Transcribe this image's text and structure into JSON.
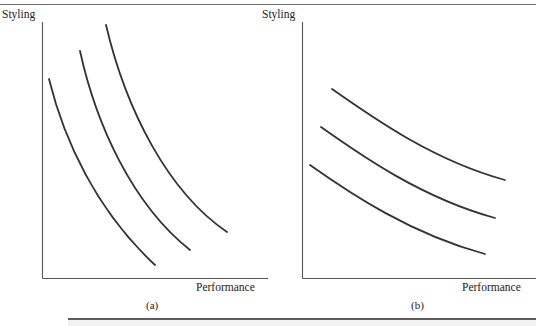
{
  "figure": {
    "rules": {
      "top_rule": "horizontal-rule",
      "bottom_rule": "horizontal-rule"
    },
    "panels": [
      {
        "id": "a",
        "caption": "(a)",
        "y_axis_label": "Styling",
        "x_axis_label": "Performance",
        "axis": {
          "x0": 42,
          "y0": 22,
          "x1": 268,
          "y1": 278
        }
      },
      {
        "id": "b",
        "caption": "(b)",
        "y_axis_label": "Styling",
        "x_axis_label": "Performance",
        "axis": {
          "x0": 302,
          "y0": 22,
          "x1": 536,
          "y1": 278
        }
      }
    ]
  },
  "chart_data": [
    {
      "type": "line",
      "title": "(a)",
      "xlabel": "Performance",
      "ylabel": "Styling",
      "grid": false,
      "legend": "none",
      "xlim": [
        0,
        1
      ],
      "ylim": [
        0,
        1
      ],
      "note": "Three steeply-curved convex indifference curves (strong trade-off)",
      "series": [
        {
          "name": "curve-1",
          "path": "M 49 79 C 64 140, 96 210, 155 265",
          "x": [
            0.03,
            0.12,
            0.27,
            0.5
          ],
          "y": [
            0.78,
            0.57,
            0.33,
            0.05
          ]
        },
        {
          "name": "curve-2",
          "path": "M 80 51 C 96 124, 132 204, 190 250",
          "x": [
            0.17,
            0.26,
            0.43,
            0.65
          ],
          "y": [
            0.89,
            0.64,
            0.31,
            0.11
          ]
        },
        {
          "name": "curve-3",
          "path": "M 106 25 C 126 110, 168 192, 227 232",
          "x": [
            0.28,
            0.39,
            0.57,
            0.82
          ],
          "y": [
            0.99,
            0.71,
            0.37,
            0.18
          ]
        }
      ]
    },
    {
      "type": "line",
      "title": "(b)",
      "xlabel": "Performance",
      "ylabel": "Styling",
      "grid": false,
      "legend": "none",
      "xlim": [
        0,
        1
      ],
      "ylim": [
        0,
        1
      ],
      "note": "Three gently-sloping, nearly flat indifference curves (weak trade-off)",
      "series": [
        {
          "name": "curve-1",
          "path": "M 332 89 C 372 117, 432 160, 505 180",
          "x": [
            0.13,
            0.3,
            0.55,
            0.87
          ],
          "y": [
            0.74,
            0.63,
            0.46,
            0.38
          ]
        },
        {
          "name": "curve-2",
          "path": "M 321 127 C 362 156, 422 198, 495 218",
          "x": [
            0.08,
            0.26,
            0.51,
            0.82
          ],
          "y": [
            0.59,
            0.48,
            0.31,
            0.23
          ]
        },
        {
          "name": "curve-3",
          "path": "M 310 165 C 351 194, 411 234, 485 254",
          "x": [
            0.03,
            0.21,
            0.47,
            0.78
          ],
          "y": [
            0.44,
            0.33,
            0.17,
            0.09
          ]
        }
      ]
    }
  ]
}
